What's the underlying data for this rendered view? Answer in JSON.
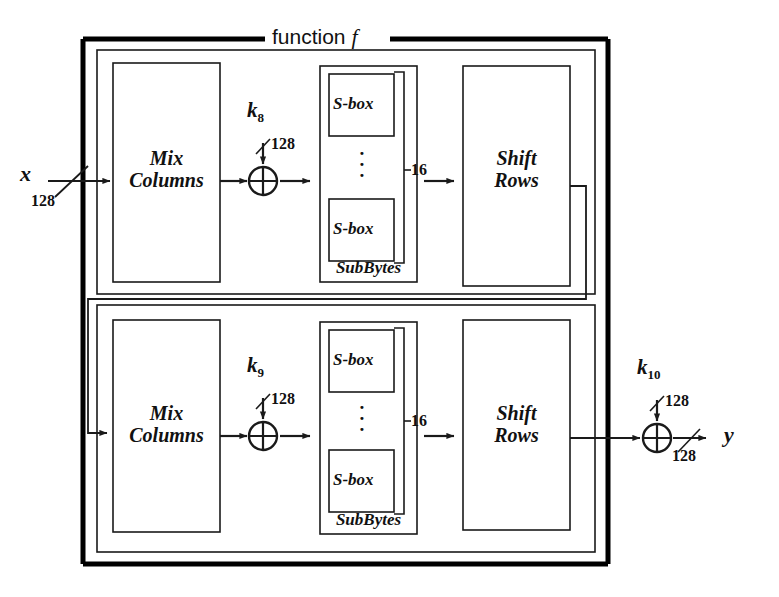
{
  "diagram": {
    "title": "function f",
    "title_prefix": "function",
    "title_symbol": "f",
    "type": "block-diagram"
  },
  "io": {
    "input_label": "x",
    "input_width": "128",
    "output_label": "y",
    "output_width": "128"
  },
  "rounds": [
    {
      "index": 0,
      "key_label": "k",
      "key_subscript": "8",
      "key_width": "128",
      "blocks": {
        "mix_columns": "Mix\nColumns",
        "mix_columns_line1": "Mix",
        "mix_columns_line2": "Columns",
        "xor_symbol": "⊕",
        "subbytes": "SubBytes",
        "sbox_top": "S-box",
        "sbox_bottom": "S-box",
        "sbox_count": "16",
        "vertical_dots": "·\n·\n·",
        "shift_rows_line1": "Shift",
        "shift_rows_line2": "Rows"
      }
    },
    {
      "index": 1,
      "key_label": "k",
      "key_subscript": "9",
      "key_width": "128",
      "blocks": {
        "mix_columns": "Mix\nColumns",
        "mix_columns_line1": "Mix",
        "mix_columns_line2": "Columns",
        "xor_symbol": "⊕",
        "subbytes": "SubBytes",
        "sbox_top": "S-box",
        "sbox_bottom": "S-box",
        "sbox_count": "16",
        "vertical_dots": "·\n·\n·",
        "shift_rows_line1": "Shift",
        "shift_rows_line2": "Rows"
      }
    }
  ],
  "final_key": {
    "key_label": "k",
    "key_subscript": "10",
    "key_width": "128",
    "xor_symbol": "⊕"
  },
  "colors": {
    "background": "#ffffff",
    "stroke": "#1a1a1a",
    "frame_stroke": "#000000"
  }
}
